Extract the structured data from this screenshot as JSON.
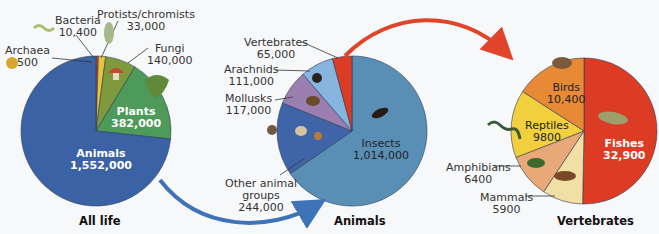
{
  "chart_data": [
    {
      "type": "pie",
      "title": "All life",
      "start_angle": "12 o'clock, clockwise",
      "categories": [
        "Archaea",
        "Bacteria",
        "Protists/chromists",
        "Fungi",
        "Plants",
        "Animals"
      ],
      "values": [
        500,
        10400,
        33000,
        140000,
        382000,
        1552000
      ],
      "colors": [
        "#d9a520",
        "#d6402b",
        "#e8c43a",
        "#7e9a3c",
        "#4e9a5a",
        "#3c62a6"
      ],
      "labels": [
        {
          "name": "Archaea",
          "value": "500"
        },
        {
          "name": "Bacteria",
          "value": "10,400"
        },
        {
          "name": "Protists/chromists",
          "value": "33,000"
        },
        {
          "name": "Fungi",
          "value": "140,000"
        },
        {
          "name": "Plants",
          "value": "382,000"
        },
        {
          "name": "Animals",
          "value": "1,552,000"
        }
      ]
    },
    {
      "type": "pie",
      "title": "Animals",
      "start_angle": "12 o'clock, clockwise",
      "categories": [
        "Insects",
        "Other animal groups",
        "Mollusks",
        "Arachnids",
        "Vertebrates"
      ],
      "values": [
        1014000,
        244000,
        117000,
        111000,
        65000
      ],
      "colors": [
        "#5a8fb5",
        "#4064a8",
        "#9a7fb0",
        "#86b6df",
        "#dc3b24"
      ],
      "labels": [
        {
          "name": "Insects",
          "value": "1,014,000"
        },
        {
          "name": "Other animal groups",
          "value": "244,000"
        },
        {
          "name": "Mollusks",
          "value": "117,000"
        },
        {
          "name": "Arachnids",
          "value": "111,000"
        },
        {
          "name": "Vertebrates",
          "value": "65,000"
        }
      ]
    },
    {
      "type": "pie",
      "title": "Vertebrates",
      "start_angle": "12 o'clock, clockwise",
      "categories": [
        "Fishes",
        "Mammals",
        "Amphibians",
        "Reptiles",
        "Birds"
      ],
      "values": [
        32900,
        5900,
        6400,
        9800,
        10400
      ],
      "colors": [
        "#dc3b24",
        "#f2dfa6",
        "#e8a877",
        "#f1cf3d",
        "#e88a35"
      ],
      "labels": [
        {
          "name": "Fishes",
          "value": "32,900"
        },
        {
          "name": "Mammals",
          "value": "5900"
        },
        {
          "name": "Amphibians",
          "value": "6400"
        },
        {
          "name": "Reptiles",
          "value": "9800"
        },
        {
          "name": "Birds",
          "value": "10,400"
        }
      ]
    }
  ],
  "annotations": {
    "arrow_blue": "Animals slice of All life expands into Animals chart",
    "arrow_red": "Vertebrates slice of Animals expands into Vertebrates chart"
  }
}
